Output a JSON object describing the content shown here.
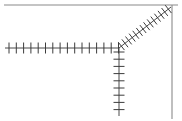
{
  "canvas": {
    "width": 182,
    "height": 121,
    "background_color": "#ffffff",
    "title": "hatched junction line diagram"
  },
  "colors": {
    "line_stroke": "#4a4a4a",
    "tick_stroke": "#3c3c3c",
    "border_stroke": "#8a8a8a",
    "background": "#ffffff"
  },
  "junction": {
    "label": "junction-node",
    "x": 119,
    "y": 48
  },
  "borders": [
    {
      "name": "top-border",
      "x1": 4,
      "y1": 5,
      "x2": 178,
      "y2": 5,
      "stroke_width": 1.1
    },
    {
      "name": "right-border",
      "x1": 172,
      "y1": 5,
      "x2": 172,
      "y2": 119,
      "stroke_width": 1.1
    }
  ],
  "chart_data": {
    "type": "diagram",
    "xlabel": "",
    "ylabel": "",
    "xlim": [
      0,
      182
    ],
    "ylim": [
      0,
      121
    ],
    "grid": false,
    "legend": "none",
    "series": [
      {
        "name": "horizontal-hatched-line",
        "orientation": "horizontal",
        "x1": 5,
        "y1": 48,
        "x2": 119,
        "y2": 48,
        "stroke_width": 1.0,
        "tick_count": 16,
        "tick_length": 11,
        "tick_angle_deg": 90,
        "tick_spacing": 7.3,
        "tick_start_offset": 4
      },
      {
        "name": "vertical-hatched-line",
        "orientation": "vertical",
        "x1": 119,
        "y1": 48,
        "x2": 119,
        "y2": 116,
        "stroke_width": 1.0,
        "tick_count": 10,
        "tick_length": 11,
        "tick_angle_deg": 90,
        "tick_spacing": 7.2,
        "tick_start_offset": 4
      },
      {
        "name": "diagonal-hatched-line",
        "orientation": "diagonal",
        "x1": 119,
        "y1": 48,
        "x2": 171,
        "y2": 7,
        "stroke_width": 1.0,
        "tick_count": 14,
        "tick_length": 10,
        "tick_angle_deg": 90,
        "tick_spacing": 4.6,
        "tick_start_offset": 3
      }
    ]
  }
}
